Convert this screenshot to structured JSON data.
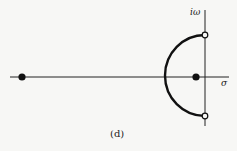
{
  "diagram": {
    "type": "pole-zero plot / root locus (s-plane)",
    "caption": "(d)",
    "axes": {
      "vertical_label": "iω",
      "horizontal_label": "σ"
    },
    "poles": [
      {
        "name": "far-left pole",
        "marker": "filled",
        "position": "on real axis, far left"
      },
      {
        "name": "near-origin pole",
        "marker": "filled",
        "position": "on real axis, just left of imaginary axis"
      }
    ],
    "zeros": [
      {
        "name": "upper zero",
        "marker": "open",
        "position": "on imaginary axis, upper"
      },
      {
        "name": "lower zero",
        "marker": "open",
        "position": "on imaginary axis, lower"
      }
    ],
    "locus": {
      "shape": "semicircle in left half-plane connecting upper and lower zeros"
    },
    "colors": {
      "ink": "#111111",
      "background": "#f7f7f5"
    }
  }
}
